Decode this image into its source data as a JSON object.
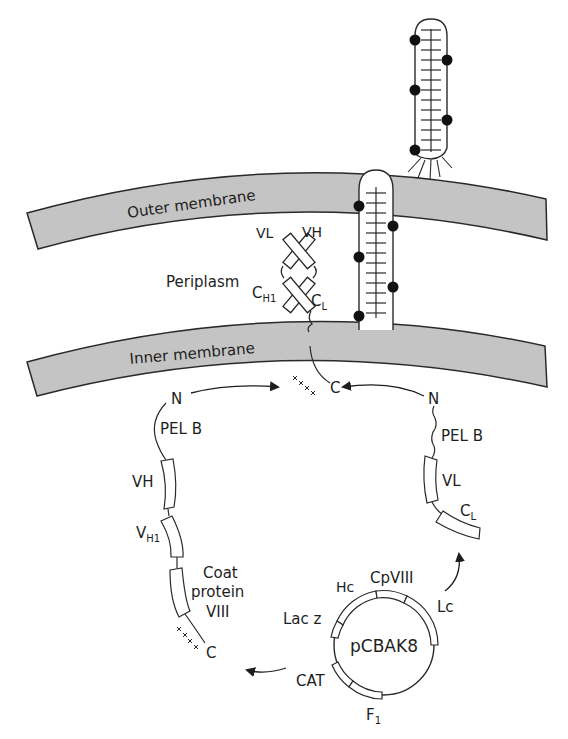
{
  "membranes": {
    "outer": {
      "label": "Outer membrane"
    },
    "inner": {
      "label": "Inner membrane"
    },
    "fill_color": "#c4c4c4",
    "stroke_color": "#2a2a2a"
  },
  "periplasm": {
    "label": "Periplasm"
  },
  "fab": {
    "vl": "VL",
    "vh": "VH",
    "ch1": {
      "main": "C",
      "sub": "H1"
    },
    "cl": {
      "main": "C",
      "sub": "L"
    }
  },
  "heavy_chain": {
    "n_terminus": "N",
    "signal": "PEL B",
    "domains": [
      {
        "main": "VH",
        "sub": ""
      },
      {
        "main": "V",
        "sub": "H1"
      }
    ],
    "coat_label": [
      "Coat",
      "protein",
      "VIII"
    ],
    "c_terminus": "C"
  },
  "light_chain": {
    "n_terminus": "N",
    "signal": "PEL B",
    "vl": "VL",
    "cl": {
      "main": "C",
      "sub": "L"
    }
  },
  "anchor": {
    "c_terminus": "C"
  },
  "plasmid": {
    "name": "pCBAK8",
    "genes": {
      "hc": "Hc",
      "cpviii": "CpVIII",
      "lc": "Lc",
      "lacz": "Lac z",
      "cat": "CAT",
      "f1": {
        "main": "F",
        "sub": "1"
      }
    }
  },
  "phage": {
    "dot_color": "#111111"
  }
}
